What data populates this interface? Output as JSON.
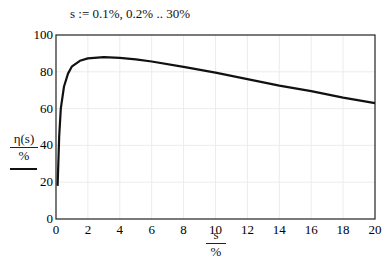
{
  "definition": "s := 0.1%, 0.2% .. 30%",
  "chart_data": {
    "type": "line",
    "title": "",
    "xlabel": "s / %",
    "ylabel": "η(s) / %",
    "x_label_numerator": "s",
    "x_label_denominator": "%",
    "y_label_numerator": "η(s)",
    "y_label_denominator": "%",
    "xlim": [
      0,
      20
    ],
    "ylim": [
      0,
      100
    ],
    "x_ticks": [
      "0",
      "2",
      "4",
      "6",
      "8",
      "10",
      "12",
      "14",
      "16",
      "18",
      "20"
    ],
    "y_ticks": [
      "0",
      "20",
      "40",
      "60",
      "80",
      "100"
    ],
    "grid": true,
    "legend": null,
    "series": [
      {
        "name": "η(s)",
        "color": "#111111",
        "x": [
          0.1,
          0.2,
          0.3,
          0.5,
          0.75,
          1,
          1.5,
          2,
          3,
          4,
          5,
          6,
          8,
          10,
          12,
          14,
          16,
          18,
          20
        ],
        "y": [
          18,
          45,
          60,
          72,
          79,
          83,
          86,
          87.3,
          88,
          87.6,
          86.8,
          85.6,
          82.7,
          79.5,
          76,
          72.5,
          69.5,
          66,
          63
        ]
      }
    ]
  }
}
